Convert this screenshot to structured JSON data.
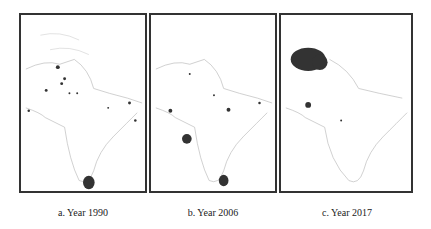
{
  "panels": [
    {
      "id": "a",
      "caption": "a. Year 1990"
    },
    {
      "id": "b",
      "caption": "b. Year 2006"
    },
    {
      "id": "c",
      "caption": "c. Year 2017"
    }
  ],
  "colors": {
    "frame": "#333333",
    "outline": "#bbbbbb",
    "points": "#333333"
  }
}
